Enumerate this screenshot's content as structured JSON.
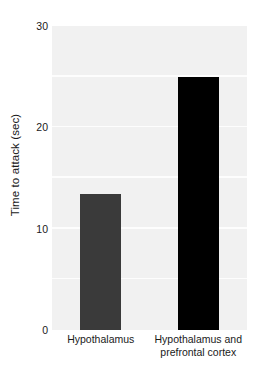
{
  "chart_data": {
    "type": "bar",
    "title": "",
    "xlabel": "",
    "ylabel": "Time to attack (sec)",
    "categories": [
      "Hypothalamus",
      "Hypothalamus and prefrontal cortex"
    ],
    "category_lines": [
      [
        "Hypothalamus"
      ],
      [
        "Hypothalamus and",
        "prefrontal cortex"
      ]
    ],
    "values": [
      13.4,
      25.0
    ],
    "bar_colors": [
      "#3a3a3a",
      "#000000"
    ],
    "ylim": [
      0,
      30
    ],
    "ytick_labels": [
      "30",
      "20",
      "10",
      "0"
    ],
    "ytick_values": [
      30,
      20,
      10,
      0
    ],
    "gridlines": [
      5,
      10,
      15,
      20,
      25
    ],
    "grid": true,
    "grid_color": "#fdfdfd",
    "plot_background": "#f1f1f1",
    "legend": null,
    "legend_position": "none"
  }
}
